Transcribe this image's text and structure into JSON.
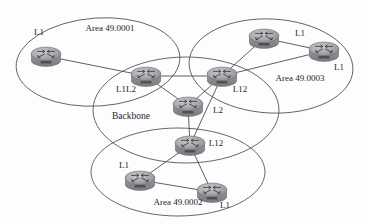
{
  "diagram": {
    "type": "network-topology",
    "colors": {
      "ellipse_stroke": "#55565a",
      "link_stroke": "#4c4d51",
      "router_body": "#8c8d91",
      "router_top": "#b9babd",
      "text": "#26262a",
      "background": "#fdfdfd"
    },
    "areas": [
      {
        "id": "area-49-0001",
        "label": "Area 49.0001",
        "label_x": 110,
        "label_y": 31,
        "cx": 98,
        "cy": 62,
        "rx": 82,
        "ry": 44,
        "rotation": -4
      },
      {
        "id": "area-49-0003",
        "label": "Area 49.0003",
        "label_x": 300,
        "label_y": 81,
        "cx": 271,
        "cy": 66,
        "rx": 82,
        "ry": 47,
        "rotation": 3
      },
      {
        "id": "backbone",
        "label": "Backbone",
        "label_x": 131,
        "label_y": 119,
        "cx": 186,
        "cy": 110,
        "rx": 93,
        "ry": 53,
        "rotation": 0
      },
      {
        "id": "area-49-0002",
        "label": "Area 49.0002",
        "label_x": 178,
        "label_y": 205,
        "cx": 178,
        "cy": 172,
        "rx": 87,
        "ry": 44,
        "rotation": 0
      }
    ],
    "routers": [
      {
        "id": "r1",
        "label": "L1",
        "area": "area-49-0001",
        "x": 46,
        "y": 56,
        "label_x": 39,
        "label_y": 35
      },
      {
        "id": "r2",
        "label": "L1L2",
        "area": "area-49-0001",
        "x": 146,
        "y": 76,
        "label_x": 126,
        "label_y": 92
      },
      {
        "id": "r3",
        "label": "L1",
        "area": "area-49-0003",
        "x": 264,
        "y": 38,
        "label_x": 300,
        "label_y": 36
      },
      {
        "id": "r4",
        "label": "L1",
        "area": "area-49-0003",
        "x": 324,
        "y": 51,
        "label_x": 339,
        "label_y": 70
      },
      {
        "id": "r5",
        "label": "L12",
        "area": "area-49-0003",
        "x": 222,
        "y": 76,
        "label_x": 240,
        "label_y": 92
      },
      {
        "id": "r6",
        "label": "L2",
        "area": "backbone",
        "x": 188,
        "y": 106,
        "label_x": 218,
        "label_y": 113
      },
      {
        "id": "r7",
        "label": "L12",
        "area": "area-49-0002",
        "x": 190,
        "y": 145,
        "label_x": 216,
        "label_y": 146
      },
      {
        "id": "r8",
        "label": "L1",
        "area": "area-49-0002",
        "x": 140,
        "y": 180,
        "label_x": 124,
        "label_y": 168
      },
      {
        "id": "r9",
        "label": "L1",
        "area": "area-49-0002",
        "x": 212,
        "y": 192,
        "label_x": 225,
        "label_y": 208
      }
    ],
    "links": [
      {
        "id": "link-r1-r2",
        "from": "r1",
        "to": "r2"
      },
      {
        "id": "link-r2-r5",
        "from": "r2",
        "to": "r5"
      },
      {
        "id": "link-r2-r6",
        "from": "r2",
        "to": "r6"
      },
      {
        "id": "link-r3-r5",
        "from": "r3",
        "to": "r5"
      },
      {
        "id": "link-r3-r4",
        "from": "r3",
        "to": "r4"
      },
      {
        "id": "link-r4-r5",
        "from": "r4",
        "to": "r5"
      },
      {
        "id": "link-r5-r6",
        "from": "r5",
        "to": "r6"
      },
      {
        "id": "link-r5-r7",
        "from": "r5",
        "to": "r7"
      },
      {
        "id": "link-r6-r7",
        "from": "r6",
        "to": "r7"
      },
      {
        "id": "link-r7-r8",
        "from": "r7",
        "to": "r8"
      },
      {
        "id": "link-r7-r9",
        "from": "r7",
        "to": "r9"
      },
      {
        "id": "link-r8-r9",
        "from": "r8",
        "to": "r9"
      }
    ]
  }
}
